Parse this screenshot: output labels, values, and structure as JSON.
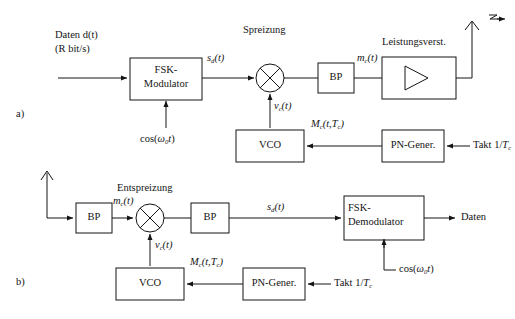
{
  "figure": {
    "type": "block-diagram",
    "stroke_color": "#141414",
    "background": "#ffffff"
  },
  "panels": [
    {
      "id": "a",
      "label": "a)",
      "role": "transmitter"
    },
    {
      "id": "b",
      "label": "b)",
      "role": "receiver"
    }
  ],
  "panel_a": {
    "label": "a)",
    "input_label_line1": "Daten d(t)",
    "input_label_line2": "(R bit/s)",
    "section_title": "Spreizung",
    "amp_title": "Leistungsverst.",
    "blocks": {
      "modulator_line1": "FSK-",
      "modulator_line2": "Modulator",
      "bandpass": "BP",
      "vco": "VCO",
      "pn_generator": "PN-Gener."
    },
    "signals": {
      "modulator_out": "s(t)",
      "modulator_out_sub": "d",
      "mixer_lo": "v(t)",
      "mixer_lo_sub": "c",
      "bandpass_out": "m(t)",
      "bandpass_out_sub": "c",
      "carrier": "cos(ω t)",
      "carrier_sub": "0",
      "pn_code": "M(t,T )",
      "pn_code_sub1": "c",
      "pn_code_sub2": "c",
      "clock": "Takt 1/T",
      "clock_sub": "c"
    },
    "icons": {
      "mixer": "mixer-multiplier-icon",
      "amplifier": "amplifier-triangle-icon",
      "antenna": "transmit-antenna-icon"
    }
  },
  "panel_b": {
    "label": "b)",
    "section_title": "Entspreizung",
    "output_label": "Daten",
    "blocks": {
      "bandpass_in": "BP",
      "bandpass_mid": "BP",
      "demodulator_line1": "FSK-",
      "demodulator_line2": "Demodulator",
      "vco": "VCO",
      "pn_generator": "PN-Gener."
    },
    "signals": {
      "antenna_out": "m(t)",
      "antenna_out_sub": "c",
      "mixer_lo": "v(t)",
      "mixer_lo_sub": "c",
      "despread_out": "s(t)",
      "despread_out_sub": "d",
      "carrier": "cos(ω t)",
      "carrier_sub": "0",
      "pn_code": "M(t,T )",
      "pn_code_sub1": "c",
      "pn_code_sub2": "c",
      "clock": "Takt 1/T",
      "clock_sub": "c"
    },
    "icons": {
      "mixer": "mixer-multiplier-icon",
      "antenna": "receive-antenna-icon"
    }
  }
}
